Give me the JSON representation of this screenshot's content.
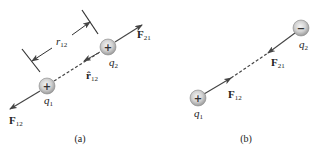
{
  "figure": {
    "panel_a": {
      "caption": "(a)",
      "q1": {
        "sign": "+",
        "label": "q",
        "sub": "1"
      },
      "q2": {
        "sign": "+",
        "label": "q",
        "sub": "2"
      },
      "distance": {
        "label": "r",
        "sub": "12"
      },
      "unit_vector": {
        "label": "r̂",
        "sub": "12"
      },
      "force_on_q1": {
        "label": "F",
        "sub": "12"
      },
      "force_on_q2": {
        "label": "F",
        "sub": "21"
      }
    },
    "panel_b": {
      "caption": "(b)",
      "q1": {
        "sign": "+",
        "label": "q",
        "sub": "1"
      },
      "q2": {
        "sign": "−",
        "label": "q",
        "sub": "2"
      },
      "force_on_q1": {
        "label": "F",
        "sub": "12"
      },
      "force_on_q2": {
        "label": "F",
        "sub": "21"
      }
    },
    "colors": {
      "line": "#444444",
      "charge_fill": "#c8c8c8",
      "charge_edge": "#999999"
    }
  }
}
